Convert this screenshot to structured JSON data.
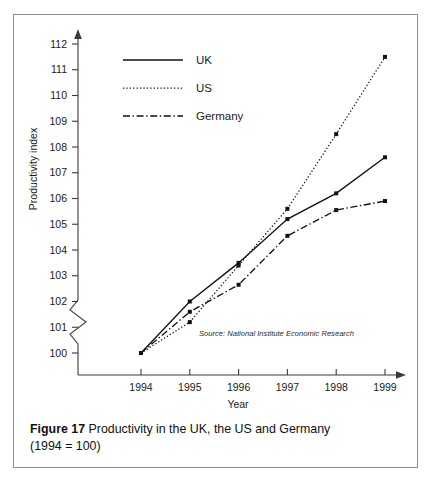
{
  "figure": {
    "caption_label": "Figure 17",
    "caption_text": "Productivity in the UK, the US and Germany",
    "caption_line2": "(1994 = 100)",
    "source_note": "Source:  National Institute Economic Research",
    "border_color": "#8d8d8d",
    "line_color": "#111111"
  },
  "chart_data": {
    "type": "line",
    "title": "Productivity in the UK, the US and Germany (1994 = 100)",
    "xlabel": "Year",
    "ylabel": "Productivity index",
    "x": [
      1994,
      1995,
      1996,
      1997,
      1998,
      1999
    ],
    "categories": [
      "1994",
      "1995",
      "1996",
      "1997",
      "1998",
      "1999"
    ],
    "xlim": [
      1994,
      1999
    ],
    "ylim": [
      100,
      112
    ],
    "yticks": [
      100,
      101,
      102,
      103,
      104,
      105,
      106,
      107,
      108,
      109,
      110,
      111,
      112
    ],
    "ytick_labels": [
      "100",
      "101",
      "102",
      "103",
      "104",
      "105",
      "106",
      "107",
      "108",
      "109",
      "110",
      "111",
      "112"
    ],
    "axis_break": true,
    "grid": false,
    "legend_position": "top-left",
    "series": [
      {
        "name": "UK",
        "style": "solid",
        "values": [
          100.0,
          102.0,
          103.5,
          105.2,
          106.2,
          107.6
        ]
      },
      {
        "name": "US",
        "style": "dotted",
        "values": [
          100.0,
          101.2,
          103.4,
          105.6,
          108.5,
          111.5
        ]
      },
      {
        "name": "Germany",
        "style": "dash-dot",
        "values": [
          100.0,
          101.6,
          102.65,
          104.55,
          105.55,
          105.9
        ]
      }
    ]
  }
}
